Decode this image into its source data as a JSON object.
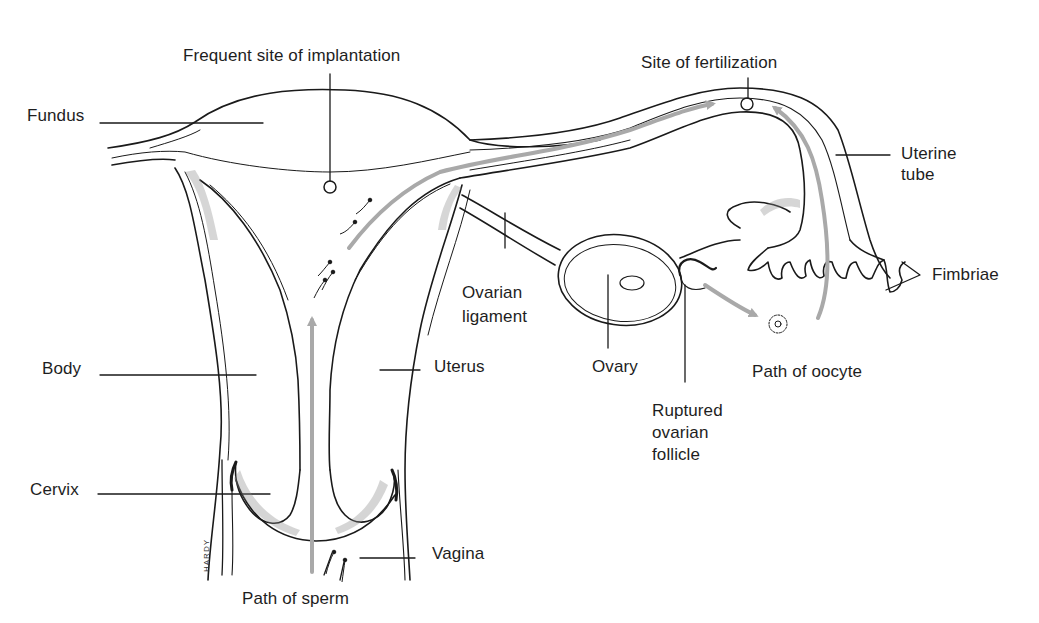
{
  "diagram": {
    "labels": {
      "implantation": "Frequent site of implantation",
      "fertilization": "Site of fertilization",
      "fundus": "Fundus",
      "uterine_tube_1": "Uterine",
      "uterine_tube_2": "tube",
      "fimbriae": "Fimbriae",
      "ovarian_ligament_1": "Ovarian",
      "ovarian_ligament_2": "ligament",
      "body": "Body",
      "uterus": "Uterus",
      "ovary": "Ovary",
      "path_oocyte": "Path of oocyte",
      "ruptured_1": "Ruptured",
      "ruptured_2": "ovarian",
      "ruptured_3": "follicle",
      "cervix": "Cervix",
      "vagina": "Vagina",
      "path_sperm": "Path of sperm"
    },
    "signature": "HARDY",
    "colors": {
      "line": "#1a1a1a",
      "arrow": "#a9a9a9",
      "stipple": "#8a8a8a",
      "background": "#ffffff"
    }
  }
}
